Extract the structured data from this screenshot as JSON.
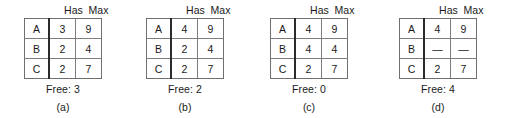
{
  "figure": {
    "row_label_header": "",
    "columns": [
      "Has",
      "Max"
    ],
    "free_label_prefix": "Free:",
    "panels": [
      {
        "caption": "(a)",
        "headers": [
          "Has",
          "Max"
        ],
        "rows": [
          {
            "name": "A",
            "has": "3",
            "max": "9"
          },
          {
            "name": "B",
            "has": "2",
            "max": "4"
          },
          {
            "name": "C",
            "has": "2",
            "max": "7"
          }
        ],
        "free_text": "Free: 3",
        "free_value": "3"
      },
      {
        "caption": "(b)",
        "headers": [
          "Has",
          "Max"
        ],
        "rows": [
          {
            "name": "A",
            "has": "4",
            "max": "9"
          },
          {
            "name": "B",
            "has": "2",
            "max": "4"
          },
          {
            "name": "C",
            "has": "2",
            "max": "7"
          }
        ],
        "free_text": "Free: 2",
        "free_value": "2"
      },
      {
        "caption": "(c)",
        "headers": [
          "Has",
          "Max"
        ],
        "rows": [
          {
            "name": "A",
            "has": "4",
            "max": "9"
          },
          {
            "name": "B",
            "has": "4",
            "max": "4"
          },
          {
            "name": "C",
            "has": "2",
            "max": "7"
          }
        ],
        "free_text": "Free: 0",
        "free_value": "0"
      },
      {
        "caption": "(d)",
        "headers": [
          "Has",
          "Max"
        ],
        "rows": [
          {
            "name": "A",
            "has": "4",
            "max": "9"
          },
          {
            "name": "B",
            "has": "—",
            "max": "—"
          },
          {
            "name": "C",
            "has": "2",
            "max": "7"
          }
        ],
        "free_text": "Free: 4",
        "free_value": "4"
      }
    ]
  },
  "chart_data": {
    "type": "table",
    "title": "",
    "columns": [
      "",
      "Has",
      "Max"
    ],
    "panels": [
      {
        "label": "(a)",
        "rows": [
          [
            "A",
            "3",
            "9"
          ],
          [
            "B",
            "2",
            "4"
          ],
          [
            "C",
            "2",
            "7"
          ]
        ],
        "free": "3"
      },
      {
        "label": "(b)",
        "rows": [
          [
            "A",
            "4",
            "9"
          ],
          [
            "B",
            "2",
            "4"
          ],
          [
            "C",
            "2",
            "7"
          ]
        ],
        "free": "2"
      },
      {
        "label": "(c)",
        "rows": [
          [
            "A",
            "4",
            "9"
          ],
          [
            "B",
            "4",
            "4"
          ],
          [
            "C",
            "2",
            "7"
          ]
        ],
        "free": "0"
      },
      {
        "label": "(d)",
        "rows": [
          [
            "A",
            "4",
            "9"
          ],
          [
            "B",
            "—",
            "—"
          ],
          [
            "C",
            "2",
            "7"
          ]
        ],
        "free": "4"
      }
    ]
  }
}
